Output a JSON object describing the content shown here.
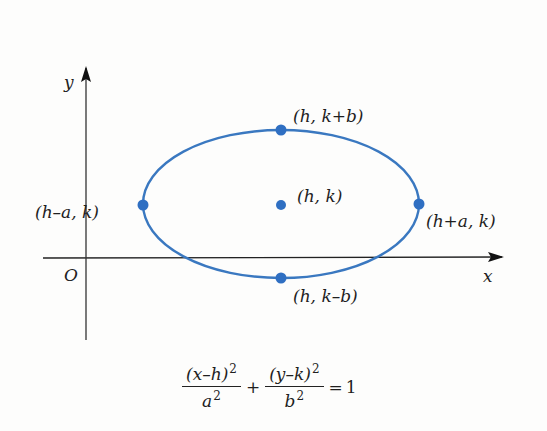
{
  "diagram": {
    "axes": {
      "x_label": "x",
      "y_label": "y",
      "origin_label": "O",
      "axis_color": "#222222"
    },
    "ellipse": {
      "color": "#3a78c0",
      "center_px": [
        281,
        204
      ],
      "rx_px": 138,
      "ry_px": 74
    },
    "points": [
      {
        "id": "center",
        "label": "(h, k)"
      },
      {
        "id": "top-vertex",
        "label": "(h, k+b)"
      },
      {
        "id": "bottom-vertex",
        "label": "(h, k–b)"
      },
      {
        "id": "left-vertex",
        "label": "(h–a, k)"
      },
      {
        "id": "right-vertex",
        "label": "(h+a, k)"
      }
    ],
    "equation": {
      "term1_numerator": "(x–h)",
      "term1_num_exp": "2",
      "term1_denominator": "a",
      "term1_den_exp": "2",
      "operator": "+",
      "term2_numerator": "(y–k)",
      "term2_num_exp": "2",
      "term2_denominator": "b",
      "term2_den_exp": "2",
      "equals": "=",
      "rhs": "1"
    }
  }
}
